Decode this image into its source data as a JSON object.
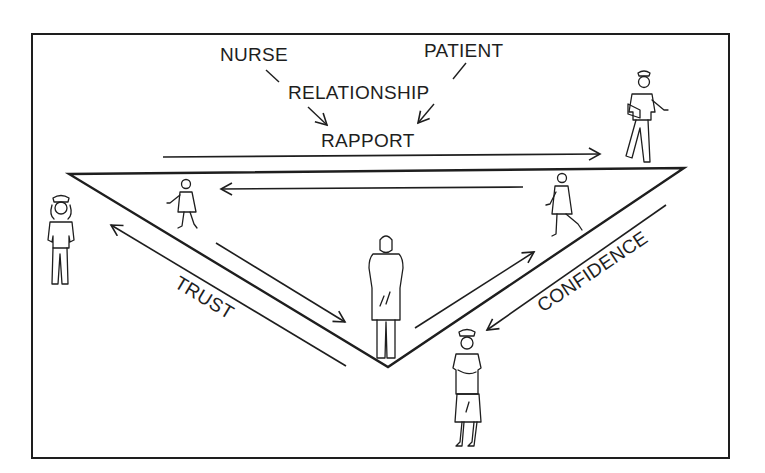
{
  "diagram": {
    "type": "nurse-patient rapport triangle",
    "labels": {
      "nurse": "NURSE",
      "patient": "PATIENT",
      "relationship": "RELATIONSHIP",
      "rapport": "RAPPORT",
      "trust": "TRUST",
      "confidence": "CONFIDENCE"
    },
    "flow": [
      {
        "from": "NURSE",
        "to": "RELATIONSHIP"
      },
      {
        "from": "PATIENT",
        "to": "RELATIONSHIP"
      },
      {
        "from": "RELATIONSHIP",
        "to": "RAPPORT"
      }
    ],
    "triangle": {
      "vertices": [
        [
          69,
          174
        ],
        [
          684,
          168
        ],
        [
          388,
          367
        ]
      ],
      "edges": [
        "top: RAPPORT",
        "left: TRUST",
        "right: CONFIDENCE"
      ]
    },
    "figures": [
      {
        "role": "nurse",
        "position": "left of triangle",
        "pose": "standing"
      },
      {
        "role": "patient",
        "position": "left edge, walking",
        "pose": "walking"
      },
      {
        "role": "patient",
        "position": "bottom vertex",
        "pose": "standing in gown"
      },
      {
        "role": "patient",
        "position": "right edge, walking",
        "pose": "walking"
      },
      {
        "role": "nurse",
        "position": "top right vertex",
        "pose": "walking"
      },
      {
        "role": "nurse",
        "position": "below right edge",
        "pose": "standing"
      }
    ],
    "colors": {
      "ink": "#1e1e1e",
      "paper": "#ffffff"
    }
  }
}
